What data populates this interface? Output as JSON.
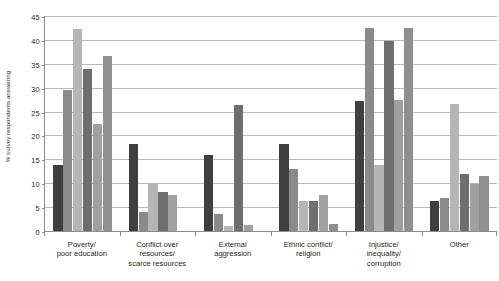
{
  "chart_data": {
    "type": "bar",
    "title": "",
    "subtitle": "",
    "xlabel": "",
    "ylabel": "% survey respondents answering",
    "ylim": [
      0,
      45
    ],
    "ytick_step": 5,
    "yticks": [
      "45",
      "40",
      "35",
      "30",
      "25",
      "20",
      "15",
      "10",
      "5",
      "0"
    ],
    "grid": true,
    "legend": "none",
    "categories": [
      "Poverty/\npoor education",
      "Conflict over\nresources/\nscarce resources",
      "External\naggression",
      "Ethnic conflict/\nreligion",
      "Injustice/\ninequality/\ncorruption",
      "Other"
    ],
    "series": [
      {
        "name": "Series 1",
        "color": "#3f3f40",
        "values": [
          13.8,
          18.3,
          16.0,
          18.2,
          27.3,
          6.2
        ]
      },
      {
        "name": "Series 2",
        "color": "#8a8a8a",
        "values": [
          29.5,
          4.0,
          3.5,
          13.0,
          42.5,
          7.0
        ]
      },
      {
        "name": "Series 3",
        "color": "#b5b5b5",
        "values": [
          42.2,
          10.0,
          1.0,
          6.3,
          13.8,
          26.5
        ]
      },
      {
        "name": "Series 4",
        "color": "#6e6e6e",
        "values": [
          33.9,
          8.2,
          26.3,
          6.3,
          39.7,
          12.0
        ]
      },
      {
        "name": "Series 5",
        "color": "#a0a0a0",
        "values": [
          22.3,
          7.5,
          1.3,
          7.5,
          27.4,
          9.8
        ]
      },
      {
        "name": "Series 6",
        "color": "#8f8f8f",
        "values": [
          36.6,
          0.0,
          0.0,
          1.5,
          42.4,
          11.6
        ]
      }
    ]
  },
  "colors": {
    "axis": "#8c8c8c",
    "gridline": "#b9b9b9",
    "text": "#231f20",
    "background": "#ffffff"
  }
}
